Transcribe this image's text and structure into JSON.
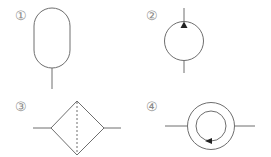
{
  "diagram": {
    "stroke_color": "#6e6e6e",
    "symbols": [
      {
        "id": 1,
        "label": "①",
        "name": "accumulator"
      },
      {
        "id": 2,
        "label": "②",
        "name": "hydraulic-pump"
      },
      {
        "id": 3,
        "label": "③",
        "name": "filter"
      },
      {
        "id": 4,
        "label": "④",
        "name": "flow-meter"
      }
    ]
  }
}
